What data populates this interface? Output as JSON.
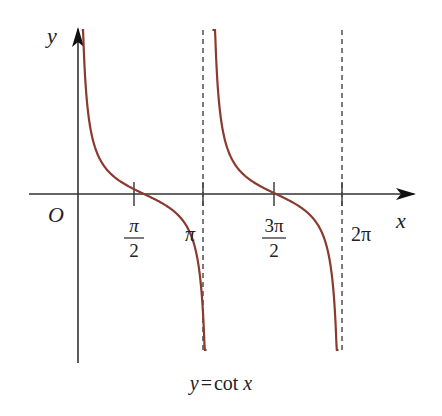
{
  "chart_data": {
    "type": "line",
    "function": "cot",
    "xlabel": "x",
    "ylabel": "y",
    "origin_label": "O",
    "x_ticks": [
      {
        "value": 1.5708,
        "label_num": "π",
        "label_den": "2",
        "label": "π/2"
      },
      {
        "value": 3.1416,
        "label": "π"
      },
      {
        "value": 4.7124,
        "label_num": "3π",
        "label_den": "2",
        "label": "3π/2"
      },
      {
        "value": 6.2832,
        "label": "2π"
      }
    ],
    "asymptotes": [
      3.1416,
      6.2832
    ],
    "asymptote_style": "dashed",
    "xlim": [
      -0.3,
      6.9
    ],
    "ylim": [
      -6.2,
      6.2
    ],
    "series": [
      {
        "name": "cot x, (0, π)",
        "x_range": [
          0.09,
          3.06
        ],
        "zero_at": 1.5708
      },
      {
        "name": "cot x, (π, 2π)",
        "x_range": [
          3.2,
          6.2
        ],
        "zero_at": 4.7124
      }
    ],
    "curve_color": "#8B3A2E",
    "axis_color": "#333333",
    "grid": false,
    "legend": null
  },
  "caption": {
    "y": "y",
    "eq": "=",
    "func": "cot",
    "x": "x"
  }
}
